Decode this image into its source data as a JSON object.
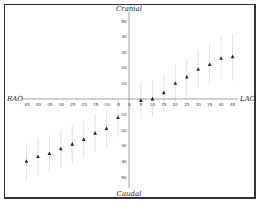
{
  "chart_data": {
    "type": "scatter",
    "title": "",
    "xlabel_left": "RAO",
    "xlabel_right": "LAO",
    "ylabel_top": "Cranial",
    "ylabel_bottom": "Caudal",
    "x_ticks": [
      -45,
      -40,
      -35,
      -30,
      -25,
      -20,
      -15,
      -10,
      -5,
      0,
      5,
      10,
      15,
      20,
      25,
      30,
      35,
      40,
      45
    ],
    "y_ticks": [
      50,
      40,
      30,
      20,
      10,
      -10,
      -20,
      -30,
      -40,
      -50
    ],
    "xlim": [
      -48,
      48
    ],
    "ylim": [
      -58,
      58
    ],
    "grid": false,
    "marker": "triangle",
    "error_bars": true,
    "series": [
      {
        "name": "mean",
        "x": [
          -45,
          -40,
          -35,
          -30,
          -25,
          -20,
          -15,
          -10,
          -5,
          5,
          10,
          15,
          20,
          25,
          30,
          35,
          40,
          45
        ],
        "y": [
          -40,
          -37,
          -35,
          -32,
          -29,
          -26,
          -22,
          -19,
          -12,
          -1,
          0,
          4,
          10,
          14,
          19,
          22,
          26,
          27
        ],
        "err": [
          12,
          12,
          12,
          12,
          12,
          12,
          12,
          12,
          12,
          12,
          12,
          12,
          12,
          12,
          12,
          13,
          14,
          15
        ]
      }
    ]
  },
  "colors": {
    "marker": "#222222",
    "axis": "#555555",
    "errorbar": "#cccccc",
    "frame": "#333333"
  }
}
